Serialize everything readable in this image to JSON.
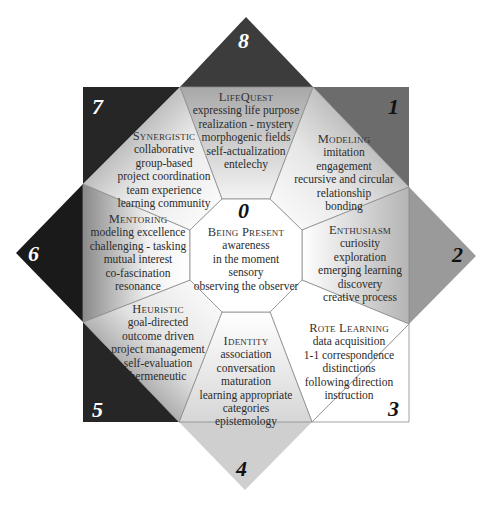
{
  "diagram": {
    "colors": {
      "corner_7": "#262626",
      "corner_1": "#6c6c6c",
      "corner_3": "#ffffff",
      "corner_5": "#262626",
      "tip_8": "#3c3c3c",
      "tip_2": "#9a9a9a",
      "tip_4": "#cfcfcf",
      "tip_6": "#1a1a1a",
      "outline": "#8a8a8a",
      "center": "#ffffff"
    },
    "numbers": {
      "n0": "0",
      "n1": "1",
      "n2": "2",
      "n3": "3",
      "n4": "4",
      "n5": "5",
      "n6": "6",
      "n7": "7",
      "n8": "8"
    },
    "regions": {
      "center": {
        "title": "Being Present",
        "lines": [
          "awareness",
          "in the moment",
          "sensory",
          "observing the observer"
        ]
      },
      "lifequest": {
        "title": "LifeQuest",
        "lines": [
          "expressing life purpose",
          "realization - mystery",
          "morphogenic fields",
          "self-actualization",
          "entelechy"
        ]
      },
      "modeling": {
        "title": "Modeling",
        "lines": [
          "imitation",
          "engagement",
          "recursive and circular",
          "relationship",
          "bonding"
        ]
      },
      "enthusiasm": {
        "title": "Enthusiasm",
        "lines": [
          "curiosity",
          "exploration",
          "emerging learning",
          "discovery",
          "creative process"
        ]
      },
      "rote_learning": {
        "title": "Rote Learning",
        "lines": [
          "data acquisition",
          "1-1 correspondence",
          "distinctions",
          "following direction",
          "instruction"
        ]
      },
      "identity": {
        "title": "Identity",
        "lines": [
          "association",
          "conversation",
          "maturation",
          "learning appropriate",
          "categories",
          "epistemology"
        ]
      },
      "heuristic": {
        "title": "Heuristic",
        "lines": [
          "goal-directed",
          "outcome driven",
          "project management",
          "self-evaluation",
          "hermeneutic"
        ]
      },
      "mentoring": {
        "title": "Mentoring",
        "lines": [
          "modeling excellence",
          "challenging - tasking",
          "mutual interest",
          "co-fascination",
          "resonance"
        ]
      },
      "synergistic": {
        "title": "Synergistic",
        "lines": [
          "collaborative",
          "group-based",
          "project coordination",
          "team experience",
          "learning community"
        ]
      }
    }
  }
}
